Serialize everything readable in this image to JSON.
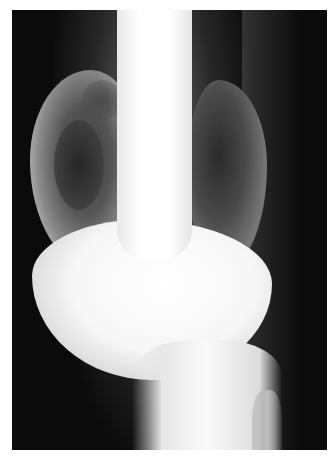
{
  "image": {
    "description": "Radiograph (X-ray) of the distal femur and knee showing an expansile, multiloculated lytic lesion with soap-bubble appearance",
    "frame": {
      "left": 12,
      "top": 10,
      "width": 315,
      "height": 440
    },
    "colors": {
      "border": "#ffffff",
      "background": "#0b0b0b",
      "bone": "#ffffff",
      "lesion_dark": "#2a2a2a"
    }
  }
}
